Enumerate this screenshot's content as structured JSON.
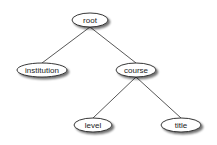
{
  "diagram": {
    "type": "tree",
    "colors": {
      "node_fill": "#ffffff",
      "node_stroke": "#222222",
      "edge": "#444444",
      "shadow": "#9a9a9a"
    },
    "nodes": [
      {
        "id": "root",
        "label": "root",
        "cx": 90,
        "cy": 20,
        "rx": 18,
        "ry": 7
      },
      {
        "id": "institution",
        "label": "institution",
        "cx": 42,
        "cy": 70,
        "rx": 25,
        "ry": 7
      },
      {
        "id": "course",
        "label": "course",
        "cx": 136,
        "cy": 70,
        "rx": 20,
        "ry": 7
      },
      {
        "id": "level",
        "label": "level",
        "cx": 93,
        "cy": 125,
        "rx": 19,
        "ry": 7
      },
      {
        "id": "title",
        "label": "title",
        "cx": 181,
        "cy": 125,
        "rx": 20,
        "ry": 7
      }
    ],
    "edges": [
      {
        "from": "root",
        "to": "institution"
      },
      {
        "from": "root",
        "to": "course"
      },
      {
        "from": "course",
        "to": "level"
      },
      {
        "from": "course",
        "to": "title"
      }
    ]
  }
}
